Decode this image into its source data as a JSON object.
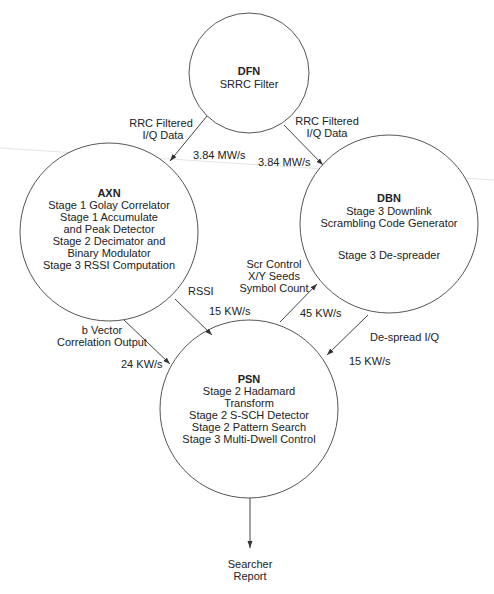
{
  "diagram": {
    "nodes": [
      {
        "id": "DFN",
        "title": "DFN",
        "lines": [
          "SRRC Filter"
        ],
        "cx": 249,
        "cy": 73,
        "r": 60
      },
      {
        "id": "AXN",
        "title": "AXN",
        "lines": [
          "Stage 1 Golay Correlator",
          "Stage 1 Accumulate",
          "and Peak Detector",
          "Stage 2 Decimator and",
          "Binary Modulator",
          "Stage 3 RSSI Computation"
        ],
        "cx": 109,
        "cy": 232,
        "r": 89
      },
      {
        "id": "DBN",
        "title": "DBN",
        "lines": [
          "Stage 3 Downlink",
          "Scrambling Code Generator",
          "",
          "Stage 3 De-spreader"
        ],
        "cx": 389,
        "cy": 224,
        "r": 89
      },
      {
        "id": "PSN",
        "title": "PSN",
        "lines": [
          "Stage 2 Hadamard",
          "Transform",
          "Stage 2 S-SCH Detector",
          "Stage 2 Pattern Search",
          "Stage 3 Multi-Dwell Control"
        ],
        "cx": 249,
        "cy": 409,
        "r": 89
      }
    ],
    "edges": [
      {
        "from": "DFN",
        "to": "AXN",
        "label": [
          "RRC Filtered",
          "I/Q Data"
        ],
        "rate": "3.84 MW/s"
      },
      {
        "from": "DFN",
        "to": "DBN",
        "label": [
          "RRC Filtered",
          "I/Q Data"
        ],
        "rate": "3.84 MW/s"
      },
      {
        "from": "AXN",
        "to": "PSN",
        "label": [
          "RSSI"
        ],
        "rate": "15 KW/s"
      },
      {
        "from": "AXN",
        "to": "PSN",
        "label": [
          "b Vector",
          "Correlation Output"
        ],
        "rate": "24 KW/s"
      },
      {
        "from": "PSN",
        "to": "DBN",
        "label": [
          "Scr Control",
          "X/Y Seeds",
          "Symbol Count"
        ],
        "rate": "45 KW/s"
      },
      {
        "from": "DBN",
        "to": "PSN",
        "label": [
          "De-spread I/Q"
        ],
        "rate": "15 KW/s"
      },
      {
        "from": "PSN",
        "to": "output",
        "label": [
          "Searcher",
          "Report"
        ],
        "rate": ""
      }
    ]
  },
  "labels": {
    "dfn_title": "DFN",
    "dfn_l1": "SRRC Filter",
    "axn_title": "AXN",
    "axn_l1": "Stage 1 Golay Correlator",
    "axn_l2": "Stage 1 Accumulate",
    "axn_l3": "and Peak Detector",
    "axn_l4": "Stage 2 Decimator and",
    "axn_l5": "Binary Modulator",
    "axn_l6": "Stage 3 RSSI Computation",
    "dbn_title": "DBN",
    "dbn_l1": "Stage 3 Downlink",
    "dbn_l2": "Scrambling Code Generator",
    "dbn_l3": "Stage 3 De-spreader",
    "psn_title": "PSN",
    "psn_l1": "Stage 2 Hadamard",
    "psn_l2": "Transform",
    "psn_l3": "Stage 2 S-SCH Detector",
    "psn_l4": "Stage 2 Pattern Search",
    "psn_l5": "Stage 3 Multi-Dwell Control",
    "e1_l1": "RRC Filtered",
    "e1_l2": "I/Q Data",
    "e1_rate": "3.84 MW/s",
    "e2_l1": "RRC Filtered",
    "e2_l2": "I/Q Data",
    "e2_rate": "3.84 MW/s",
    "e3_l1": "RSSI",
    "e3_rate": "15 KW/s",
    "e4_l1": "b Vector",
    "e4_l2": "Correlation Output",
    "e4_rate": "24 KW/s",
    "e5_l1": "Scr Control",
    "e5_l2": "X/Y Seeds",
    "e5_l3": "Symbol Count",
    "e5_rate": "45 KW/s",
    "e6_l1": "De-spread I/Q",
    "e6_rate": "15 KW/s",
    "out_l1": "Searcher",
    "out_l2": "Report"
  }
}
